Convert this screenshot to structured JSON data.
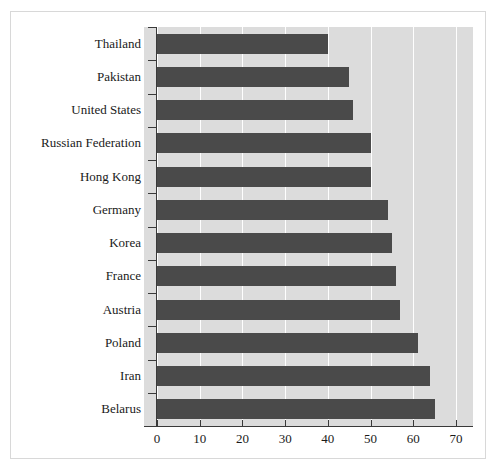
{
  "chart_data": {
    "type": "bar",
    "orientation": "horizontal",
    "title": "",
    "subtitle": "",
    "xlabel": "",
    "ylabel": "",
    "categories": [
      "Thailand",
      "Pakistan",
      "United States",
      "Russian Federation",
      "Hong Kong",
      "Germany",
      "Korea",
      "France",
      "Austria",
      "Poland",
      "Iran",
      "Belarus"
    ],
    "values": [
      40,
      45,
      46,
      50,
      50,
      54,
      55,
      56,
      57,
      61,
      64,
      65
    ],
    "xlim": [
      0,
      74
    ],
    "xticks": [
      0,
      10,
      20,
      30,
      40,
      50,
      60,
      70
    ],
    "xticklabels": [
      "0",
      "10",
      "20",
      "30",
      "40",
      "50",
      "60",
      "70"
    ],
    "grid": "vertical-white-gridlines",
    "legend": "none",
    "colors": {
      "bar": "#4a4a4a",
      "panel_background": "#dcdcdc",
      "figure_background": "#ffffff",
      "gridline": "#ffffff",
      "axis": "#3a3a3a",
      "text": "#1a1a1a",
      "frame_border": "#d8d8d8"
    }
  }
}
